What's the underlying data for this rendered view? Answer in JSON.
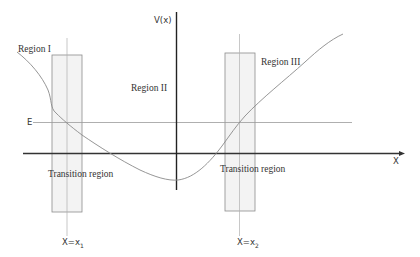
{
  "diagram": {
    "axes": {
      "x_label": "X",
      "y_label": "V(x)"
    },
    "energy_level": {
      "label": "E"
    },
    "regions": [
      {
        "id": "region-1",
        "label": "Region I"
      },
      {
        "id": "region-2",
        "label": "Region II"
      },
      {
        "id": "region-3",
        "label": "Region III"
      }
    ],
    "transition_regions": [
      {
        "id": "transition-left",
        "label": "Transition region",
        "turning_point_label": "X=x",
        "turning_point_subscript": "1"
      },
      {
        "id": "transition-right",
        "label": "Transition region",
        "turning_point_label": "X=x",
        "turning_point_subscript": "2"
      }
    ],
    "colors": {
      "axis": "#333333",
      "curve": "#8a8a8a",
      "energy_line": "#9a9a9a",
      "transition_fill": "#f2f2f2",
      "transition_stroke": "#8c8c8c",
      "turning_line": "#b0b0b0",
      "text": "#333333"
    }
  }
}
